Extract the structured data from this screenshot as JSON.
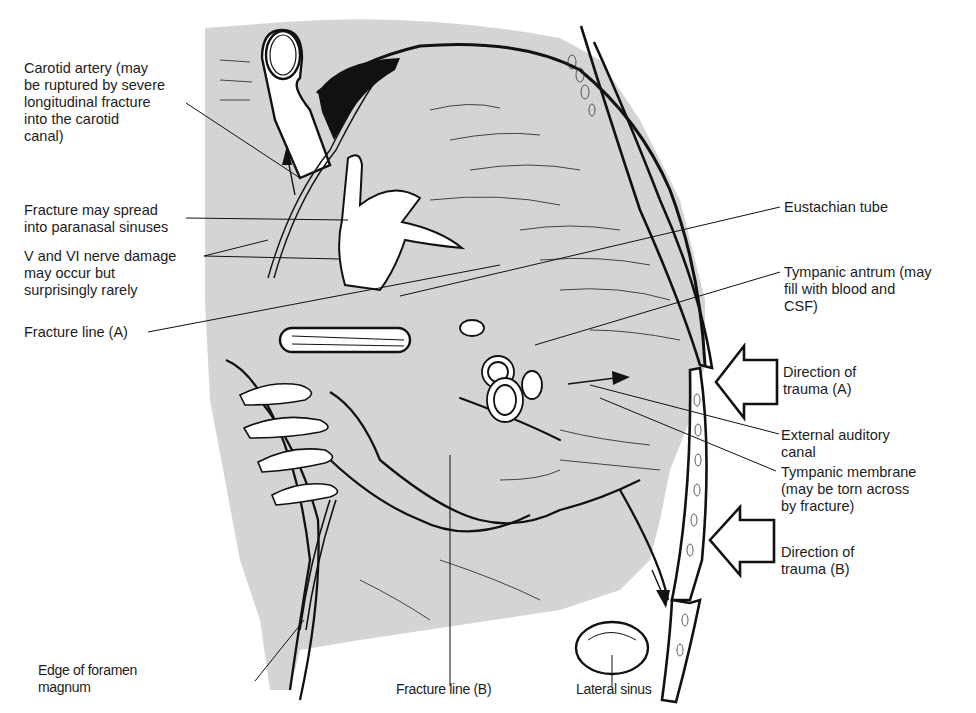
{
  "figure": {
    "type": "anatomical-diagram",
    "colors": {
      "background": "#ffffff",
      "bone_shading": "#d9d9d9",
      "ink": "#111111",
      "label_text": "#1c1c1c"
    }
  },
  "labels": {
    "carotid_artery": "Carotid artery (may\nbe ruptured by severe\nlongitudinal fracture\ninto the carotid\ncanal)",
    "paranasal": "Fracture may spread\ninto paranasal sinuses",
    "nerve_damage": "V and VI nerve damage\nmay occur but\nsurprisingly rarely",
    "fracture_line_a": "Fracture line (A)",
    "eustachian_tube": "Eustachian tube",
    "tympanic_antrum": "Tympanic antrum (may\nfill with blood and\nCSF)",
    "direction_trauma_a": "Direction of\ntrauma (A)",
    "external_auditory_canal": "External auditory\ncanal",
    "tympanic_membrane": "Tympanic membrane\n(may be torn across\nby fracture)",
    "direction_trauma_b": "Direction of\ntrauma (B)",
    "foramen_magnum": "Edge of foramen\nmagnum",
    "fracture_line_b": "Fracture line (B)",
    "lateral_sinus": "Lateral sinus"
  }
}
